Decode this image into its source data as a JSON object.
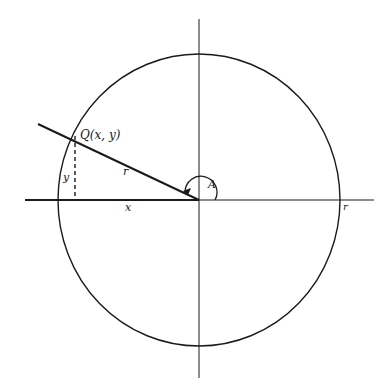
{
  "diagram": {
    "type": "unit-circle-angle",
    "colors": {
      "stroke": "#1a1a1a",
      "background": "#ffffff"
    },
    "labels": {
      "point": "Q(x, y)",
      "radius": "r",
      "horizontal_leg": "x",
      "vertical_leg": "y",
      "angle": "A",
      "axis_intercept": "r"
    }
  }
}
